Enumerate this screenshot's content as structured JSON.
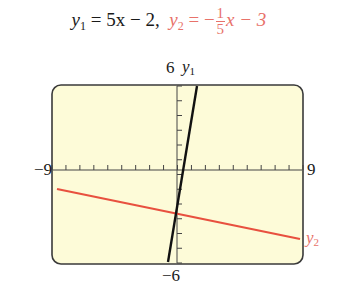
{
  "chart_data": {
    "type": "line",
    "window": {
      "xmin": -9,
      "xmax": 9,
      "ymin": -6,
      "ymax": 6,
      "xscale": 1,
      "yscale": 1
    },
    "axis_labels": {
      "xmin": "−9",
      "xmax": "9",
      "ymax": "6",
      "ymin": "−6"
    },
    "series": [
      {
        "name": "y1",
        "equation": "y1 = 5x − 2",
        "slope": 5,
        "intercept": -2,
        "color": "#111111",
        "points": [
          [
            -0.8,
            -6
          ],
          [
            1.6,
            6
          ]
        ]
      },
      {
        "name": "y2",
        "equation": "y2 = −(1/5)x − 3",
        "slope": -0.2,
        "intercept": -3,
        "color": "#e8503f",
        "points": [
          [
            -9,
            -1.2
          ],
          [
            9,
            -4.8
          ]
        ]
      }
    ],
    "intersection": {
      "x": 0.038,
      "y": -1.81
    },
    "annotations": [
      "y1",
      "y2"
    ],
    "background": "#fdfbd8",
    "grid": false
  },
  "title": {
    "y1_lhs": "y",
    "y1_sub": "1",
    "y1_rhs": " = 5x − 2,",
    "y2_lhs": "y",
    "y2_sub": "2",
    "y2_eq": " = −",
    "y2_num": "1",
    "y2_den": "5",
    "y2_tail": "x − 3"
  },
  "labels": {
    "ymax": "6",
    "ymin": "−6",
    "xmin": "−9",
    "xmax": "9",
    "y1": "y",
    "y1_sub": "1",
    "y2": "y",
    "y2_sub": "2"
  },
  "colors": {
    "y1": "#111111",
    "y2": "#e8503f",
    "label_red": "#e8726a",
    "screen_bg": "#fdfbd8",
    "frame": "#333333"
  }
}
